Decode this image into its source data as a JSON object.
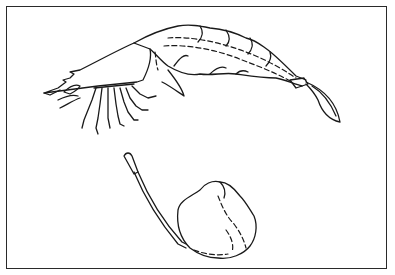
{
  "figure": {
    "description": "Line illustration of a shrimp and a swab stick with a lump of material",
    "elements": [
      {
        "name": "shrimp",
        "label": "Shrimp"
      },
      {
        "name": "swab-stick",
        "label": "Swab stick"
      },
      {
        "name": "material-lump",
        "label": "Lump"
      }
    ],
    "colors": {
      "line": "#1a1a1a",
      "background": "#ffffff",
      "frame": "#2a2a2a"
    }
  }
}
